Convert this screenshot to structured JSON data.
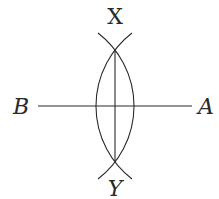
{
  "diagram": {
    "labels": {
      "top": "X",
      "bottom": "Y",
      "left": "B",
      "right": "A"
    },
    "elements": [
      {
        "type": "segment",
        "name": "AB",
        "from": "B",
        "to": "A"
      },
      {
        "type": "segment",
        "name": "XY",
        "from": "X",
        "to": "Y",
        "note": "perpendicular bisector of AB"
      },
      {
        "type": "arc",
        "name": "arc-centered-A",
        "through": [
          "X",
          "Y"
        ]
      },
      {
        "type": "arc",
        "name": "arc-centered-B",
        "through": [
          "X",
          "Y"
        ]
      }
    ],
    "color": "#2a2a2a"
  }
}
